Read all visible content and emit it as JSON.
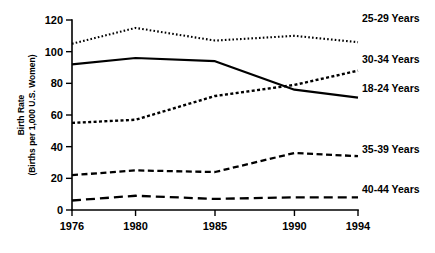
{
  "chart_data": {
    "type": "line",
    "title": "",
    "subtitle": "",
    "xlabel": "",
    "ylabel": "Birth Rate (Births per 1,000 U.S. Women)",
    "ylabel_line1": "Birth Rate",
    "ylabel_line2": "(Births per 1,000 U.S. Women)",
    "x": [
      1976,
      1980,
      1985,
      1990,
      1994
    ],
    "categories": [
      "1976",
      "1980",
      "1985",
      "1990",
      "1994"
    ],
    "xlim": [
      1976,
      1994
    ],
    "ylim": [
      0,
      120
    ],
    "yticks": [
      0,
      20,
      40,
      60,
      80,
      100,
      120
    ],
    "ytick_labels": [
      "0",
      "20",
      "40",
      "60",
      "80",
      "100",
      "120"
    ],
    "xtick_labels": [
      "1976",
      "1980",
      "1985",
      "1990",
      "1994"
    ],
    "grid": false,
    "legend_position": "line-end-labels",
    "series": [
      {
        "name": "25-29 Years",
        "label": "25-29 Years",
        "values": [
          105,
          115,
          107,
          110,
          106
        ],
        "style": "dotted",
        "dasharray": "1.6 2.2",
        "width": 2.1,
        "label_y": 22
      },
      {
        "name": "30-34 Years",
        "label": "30-34 Years",
        "values": [
          55,
          57,
          72,
          79,
          88
        ],
        "style": "dotted-medium",
        "dasharray": "3 2.4",
        "width": 2.4,
        "label_y": 63
      },
      {
        "name": "18-24 Years",
        "label": "18-24 Years",
        "values": [
          92,
          96,
          94,
          76,
          71
        ],
        "style": "solid",
        "dasharray": "none",
        "width": 2.2,
        "label_y": 92
      },
      {
        "name": "35-39 Years",
        "label": "35-39 Years",
        "values": [
          22,
          25,
          24,
          36,
          34
        ],
        "style": "dashed",
        "dasharray": "6 3.5",
        "width": 2.3,
        "label_y": 153
      },
      {
        "name": "40-44 Years",
        "label": "40-44 Years",
        "values": [
          6,
          9,
          7,
          8,
          8
        ],
        "style": "long-dash",
        "dasharray": "9 5",
        "width": 2.3,
        "label_y": 193
      }
    ],
    "colors": {
      "line": "#000000",
      "axis": "#000000",
      "background": "#ffffff"
    }
  }
}
